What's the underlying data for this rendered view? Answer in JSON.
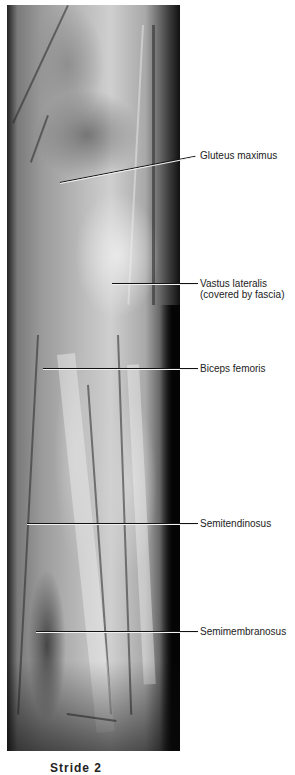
{
  "figure": {
    "labels": [
      {
        "text": "Gluteus maximus"
      },
      {
        "text": "Vastus lateralis"
      },
      {
        "text": "(covered by fascia)"
      },
      {
        "text": "Biceps femoris"
      },
      {
        "text": "Semitendinosus"
      },
      {
        "text": "Semimembranosus"
      }
    ],
    "caption": "Stride 2"
  }
}
